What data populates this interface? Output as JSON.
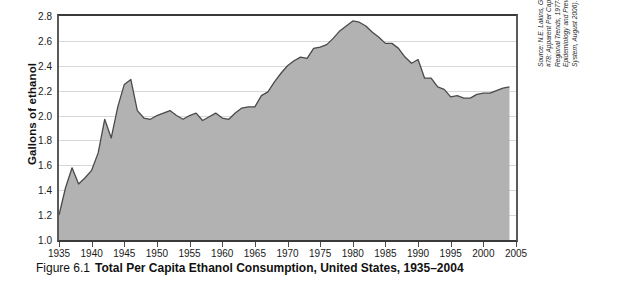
{
  "caption": {
    "figure_number": "Figure 6.1",
    "title": "Total Per Capita Ethanol Consumption, United States, 1935–2004"
  },
  "source_note": {
    "lines": [
      "Source: N.E. Lakins, G.D. Williams, and H.Y. Surveillance Report",
      "#78: Apparent Per Capita Alcohol Consumption: National, State, and",
      "Regional Trends, 1977–2004 (Bethesda, MD: NIAAA, Division of",
      "Epidemiology and Prevention Research, Alcohol Epidemiologic Data",
      "System, August 2006)."
    ]
  },
  "chart_data": {
    "type": "area",
    "title": "Total Per Capita Ethanol Consumption, United States, 1935–2004",
    "xlabel": "",
    "ylabel": "Gallons of ethanol",
    "xlim": [
      1935,
      2005
    ],
    "ylim": [
      1.0,
      2.8
    ],
    "grid": true,
    "legend": null,
    "y_ticks": [
      "1.0",
      "1.2",
      "1.4",
      "1.6",
      "1.8",
      "2.0",
      "2.2",
      "2.4",
      "2.6",
      "2.8"
    ],
    "x_ticks": [
      "1935",
      "1940",
      "1945",
      "1950",
      "1955",
      "1960",
      "1965",
      "1970",
      "1975",
      "1980",
      "1985",
      "1990",
      "1995",
      "2000",
      "2005"
    ],
    "series_name": "Gallons of ethanol per capita",
    "area_color": "#b2b2b2",
    "line_color": "#4a4a4a",
    "x": [
      1935,
      1936,
      1937,
      1938,
      1939,
      1940,
      1941,
      1942,
      1943,
      1944,
      1945,
      1946,
      1947,
      1948,
      1949,
      1950,
      1951,
      1952,
      1953,
      1954,
      1955,
      1956,
      1957,
      1958,
      1959,
      1960,
      1961,
      1962,
      1963,
      1964,
      1965,
      1966,
      1967,
      1968,
      1969,
      1970,
      1971,
      1972,
      1973,
      1974,
      1975,
      1976,
      1977,
      1978,
      1979,
      1980,
      1981,
      1982,
      1983,
      1984,
      1985,
      1986,
      1987,
      1988,
      1989,
      1990,
      1991,
      1992,
      1993,
      1994,
      1995,
      1996,
      1997,
      1998,
      1999,
      2000,
      2001,
      2002,
      2003,
      2004
    ],
    "values": [
      1.2,
      1.42,
      1.58,
      1.45,
      1.5,
      1.56,
      1.7,
      1.97,
      1.82,
      2.07,
      2.25,
      2.29,
      2.04,
      1.98,
      1.97,
      2.0,
      2.02,
      2.04,
      2.0,
      1.97,
      2.0,
      2.02,
      1.96,
      1.99,
      2.02,
      1.98,
      1.97,
      2.02,
      2.06,
      2.07,
      2.07,
      2.16,
      2.19,
      2.27,
      2.34,
      2.4,
      2.44,
      2.47,
      2.46,
      2.54,
      2.55,
      2.57,
      2.62,
      2.68,
      2.72,
      2.76,
      2.75,
      2.72,
      2.67,
      2.63,
      2.58,
      2.58,
      2.54,
      2.47,
      2.42,
      2.45,
      2.3,
      2.3,
      2.23,
      2.21,
      2.15,
      2.16,
      2.14,
      2.14,
      2.17,
      2.18,
      2.18,
      2.2,
      2.22,
      2.23
    ]
  }
}
